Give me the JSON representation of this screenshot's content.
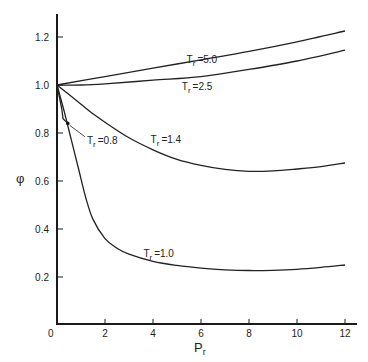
{
  "chart_data": {
    "type": "line",
    "title": "",
    "xlabel": "Pr",
    "xlabel_main": "P",
    "xlabel_sub": "r",
    "ylabel": "φ",
    "xlim": [
      0,
      12.5
    ],
    "ylim": [
      0,
      1.3
    ],
    "grid": false,
    "x_ticks": [
      0,
      2,
      4,
      6,
      8,
      10,
      12
    ],
    "x_tick_labels": [
      "0",
      "2",
      "4",
      "6",
      "8",
      "10",
      "12"
    ],
    "y_ticks": [
      0.2,
      0.4,
      0.6,
      0.8,
      1.0,
      1.2
    ],
    "y_tick_labels": [
      "0.2",
      "0.4",
      "0.6",
      "0.8",
      "1.0",
      "1.2"
    ],
    "series": [
      {
        "name": "Tr = 5.0",
        "label": "=5.0",
        "x": [
          0,
          2,
          4,
          6,
          8,
          10,
          12
        ],
        "y": [
          1.0,
          1.035,
          1.07,
          1.105,
          1.14,
          1.18,
          1.225
        ],
        "label_pos": [
          5.4,
          1.09
        ]
      },
      {
        "name": "Tr = 2.5",
        "label": "=2.5",
        "x": [
          0,
          1,
          2,
          4,
          6,
          8,
          10,
          12
        ],
        "y": [
          1.0,
          1.0,
          1.005,
          1.02,
          1.035,
          1.065,
          1.1,
          1.145
        ],
        "label_pos": [
          5.2,
          0.98
        ]
      },
      {
        "name": "Tr = 1.4",
        "label": "=1.4",
        "x": [
          0,
          0.5,
          1,
          1.5,
          2,
          3,
          4,
          5,
          6,
          7,
          8,
          9,
          10,
          11,
          12
        ],
        "y": [
          1.0,
          0.96,
          0.92,
          0.88,
          0.845,
          0.78,
          0.73,
          0.69,
          0.665,
          0.648,
          0.64,
          0.642,
          0.65,
          0.66,
          0.675
        ],
        "label_pos": [
          3.9,
          0.76
        ]
      },
      {
        "name": "Tr = 1.0",
        "label": "=1.0",
        "x": [
          0,
          0.3,
          0.6,
          0.9,
          1.2,
          1.5,
          2,
          2.5,
          3,
          4,
          5,
          6,
          7,
          8,
          9,
          10,
          11,
          12
        ],
        "y": [
          1.0,
          0.89,
          0.77,
          0.65,
          0.53,
          0.44,
          0.36,
          0.32,
          0.295,
          0.265,
          0.248,
          0.237,
          0.23,
          0.227,
          0.228,
          0.232,
          0.24,
          0.25
        ],
        "label_pos": [
          3.6,
          0.285
        ]
      },
      {
        "name": "Tr = 0.8",
        "label": "=0.8",
        "x": [
          0,
          0.1,
          0.2,
          0.25,
          0.45
        ],
        "y": [
          1.0,
          0.95,
          0.9,
          0.86,
          0.84
        ],
        "label_pos": [
          1.25,
          0.755
        ],
        "marker": [
          0.45,
          0.84
        ]
      }
    ]
  },
  "labels": {
    "tr_prefix": "T",
    "tr_sub": "r"
  }
}
